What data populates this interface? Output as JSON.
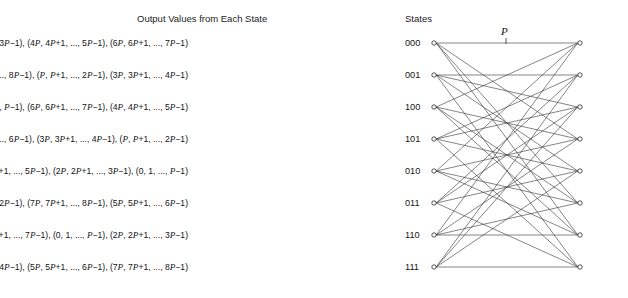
{
  "headers": {
    "output_title": "Output Values from Each State",
    "states_title": "States"
  },
  "annotations": {
    "period_label": "P"
  },
  "states": [
    {
      "label": "000",
      "output_text": "(0, 1, ..., P−1), (2P, 2P+1, ..., 3P−1), (4P, 4P+1, ..., 5P−1), (6P, 6P+1, ..., 7P−1)",
      "output_groups": [
        {
          "start": "0",
          "second": "1",
          "end": "P−1"
        },
        {
          "start": "2P",
          "second": "2P+1",
          "end": "3P−1"
        },
        {
          "start": "4P",
          "second": "4P+1",
          "end": "5P−1"
        },
        {
          "start": "6P",
          "second": "6P+1",
          "end": "7P−1"
        }
      ]
    },
    {
      "label": "001",
      "output_text": "(5P, 5P+1, ..., 6P−1), (7P, 7P+1, ..., 8P−1), (P, P+1, ..., 2P−1), (3P, 3P+1, ..., 4P−1)",
      "output_groups": [
        {
          "start": "5P",
          "second": "5P+1",
          "end": "6P−1"
        },
        {
          "start": "7P",
          "second": "7P+1",
          "end": "8P−1"
        },
        {
          "start": "P",
          "second": "P+1",
          "end": "2P−1"
        },
        {
          "start": "3P",
          "second": "3P+1",
          "end": "4P−1"
        }
      ]
    },
    {
      "label": "100",
      "output_text": "(2P, 2P+1, ..., 3P−1), (0, 1, ..., P−1), (6P, 6P+1, ..., 7P−1), (4P, 4P+1, ..., 5P−1)",
      "output_groups": [
        {
          "start": "2P",
          "second": "2P+1",
          "end": "3P−1"
        },
        {
          "start": "0",
          "second": "1",
          "end": "P−1"
        },
        {
          "start": "6P",
          "second": "6P+1",
          "end": "7P−1"
        },
        {
          "start": "4P",
          "second": "4P+1",
          "end": "5P−1"
        }
      ]
    },
    {
      "label": "101",
      "output_text": "(7P, 7P+1, ..., 8P−1), (5P, 5P+1, ..., 6P−1), (3P, 3P+1, ..., 4P−1), (P, P+1, ..., 2P−1)",
      "output_groups": [
        {
          "start": "7P",
          "second": "7P+1",
          "end": "8P−1"
        },
        {
          "start": "5P",
          "second": "5P+1",
          "end": "6P−1"
        },
        {
          "start": "3P",
          "second": "3P+1",
          "end": "4P−1"
        },
        {
          "start": "P",
          "second": "P+1",
          "end": "2P−1"
        }
      ]
    },
    {
      "label": "010",
      "output_text": "(6P, 6P+1, ..., 7P−1), (4P, 4P+1, ..., 5P−1), (2P, 2P+1, ..., 3P−1), (0, 1, ..., P−1)",
      "output_groups": [
        {
          "start": "6P",
          "second": "6P+1",
          "end": "7P−1"
        },
        {
          "start": "4P",
          "second": "4P+1",
          "end": "5P−1"
        },
        {
          "start": "2P",
          "second": "2P+1",
          "end": "3P−1"
        },
        {
          "start": "0",
          "second": "1",
          "end": "P−1"
        }
      ]
    },
    {
      "label": "011",
      "output_text": "(3P, 3P+1, ..., 4P−1), (P, P+1, ..., 2P−1), (7P, 7P+1, ..., 8P−1), (5P, 5P+1, ..., 6P−1)",
      "output_groups": [
        {
          "start": "3P",
          "second": "3P+1",
          "end": "4P−1"
        },
        {
          "start": "P",
          "second": "P+1",
          "end": "2P−1"
        },
        {
          "start": "7P",
          "second": "7P+1",
          "end": "8P−1"
        },
        {
          "start": "5P",
          "second": "5P+1",
          "end": "6P−1"
        }
      ]
    },
    {
      "label": "110",
      "output_text": "(4P, 4P+1, ..., 5P−1), (6P, 6P+1, ..., 7P−1), (0, 1, ..., P−1), (2P, 2P+1, ..., 3P−1)",
      "output_groups": [
        {
          "start": "4P",
          "second": "4P+1",
          "end": "5P−1"
        },
        {
          "start": "6P",
          "second": "6P+1",
          "end": "7P−1"
        },
        {
          "start": "0",
          "second": "1",
          "end": "P−1"
        },
        {
          "start": "2P",
          "second": "2P+1",
          "end": "3P−1"
        }
      ]
    },
    {
      "label": "111",
      "output_text": "(P, P+1, ..., 2P−1), (3P, 3P+1, ..., 4P−1), (5P, 5P+1, ..., 6P−1), (7P, 7P+1, ..., 8P−1)",
      "output_groups": [
        {
          "start": "P",
          "second": "P+1",
          "end": "2P−1"
        },
        {
          "start": "3P",
          "second": "3P+1",
          "end": "4P−1"
        },
        {
          "start": "5P",
          "second": "5P+1",
          "end": "6P−1"
        },
        {
          "start": "7P",
          "second": "7P+1",
          "end": "8P−1"
        }
      ]
    }
  ],
  "trellis": {
    "left_node_x": 9,
    "right_node_x": 155,
    "node_radius": 2.2,
    "row_y": [
      13,
      45,
      77,
      109,
      141,
      173,
      205,
      237
    ],
    "tick_x": 81,
    "edges": [
      {
        "from": 0,
        "to": [
          0,
          3,
          5,
          6
        ]
      },
      {
        "from": 1,
        "to": [
          2,
          1,
          7,
          4
        ]
      },
      {
        "from": 2,
        "to": [
          3,
          0,
          6,
          5
        ]
      },
      {
        "from": 3,
        "to": [
          1,
          2,
          4,
          7
        ]
      },
      {
        "from": 4,
        "to": [
          6,
          5,
          3,
          0
        ]
      },
      {
        "from": 5,
        "to": [
          4,
          7,
          1,
          2
        ]
      },
      {
        "from": 6,
        "to": [
          5,
          6,
          0,
          3
        ]
      },
      {
        "from": 7,
        "to": [
          7,
          4,
          2,
          1
        ]
      }
    ]
  },
  "colors": {
    "background": "#ffffff",
    "text": "#141414",
    "edge": "#3a3a3a",
    "node_stroke": "#2a2a2a"
  }
}
